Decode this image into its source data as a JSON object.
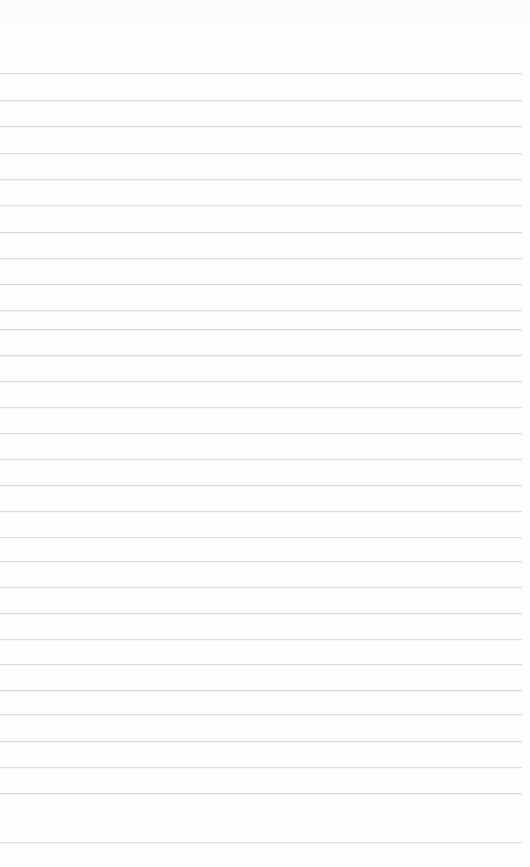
{
  "document": {
    "type": "lined-paper",
    "title": "Blank Ruled Notebook Page",
    "page_label": "",
    "text_content": "",
    "has_text": false,
    "has_handwriting": false,
    "has_margin_rule": false,
    "has_holes": false,
    "orientation": "portrait"
  },
  "canvas": {
    "width": 530,
    "height": 867,
    "background_color": "#ffffff",
    "paper_color": "#fefefe"
  },
  "ruling": {
    "line_color": "#b8bcc0",
    "line_thickness_px": 1,
    "line_spacing_px": 26.5,
    "line_count": 30,
    "first_line_y": 73,
    "last_line_y": 842,
    "line_start_x": 0,
    "line_end_x": 522,
    "top_margin_px": 72,
    "bottom_margin_px": 25,
    "right_inset_px": 8,
    "line_opacities": [
      0.55,
      0.5,
      0.55,
      0.5,
      0.52,
      0.45,
      0.55,
      0.5,
      0.55,
      0.48,
      0.52,
      0.55,
      0.5,
      0.46,
      0.55,
      0.5,
      0.55,
      0.52,
      0.45,
      0.55,
      0.5,
      0.55,
      0.48,
      0.52,
      0.55,
      0.5,
      0.55,
      0.45,
      0.52,
      0.5
    ],
    "line_positions_y": [
      73,
      100,
      126,
      153,
      179,
      205,
      232,
      258,
      284,
      310,
      329,
      355,
      381,
      407,
      433,
      459,
      485,
      511,
      537,
      561,
      587,
      613,
      639,
      664,
      690,
      714,
      741,
      767,
      793,
      842
    ]
  },
  "writing_lines": [
    {
      "index": 1,
      "content": ""
    },
    {
      "index": 2,
      "content": ""
    },
    {
      "index": 3,
      "content": ""
    },
    {
      "index": 4,
      "content": ""
    },
    {
      "index": 5,
      "content": ""
    },
    {
      "index": 6,
      "content": ""
    },
    {
      "index": 7,
      "content": ""
    },
    {
      "index": 8,
      "content": ""
    },
    {
      "index": 9,
      "content": ""
    },
    {
      "index": 10,
      "content": ""
    },
    {
      "index": 11,
      "content": ""
    },
    {
      "index": 12,
      "content": ""
    },
    {
      "index": 13,
      "content": ""
    },
    {
      "index": 14,
      "content": ""
    },
    {
      "index": 15,
      "content": ""
    },
    {
      "index": 16,
      "content": ""
    },
    {
      "index": 17,
      "content": ""
    },
    {
      "index": 18,
      "content": ""
    },
    {
      "index": 19,
      "content": ""
    },
    {
      "index": 20,
      "content": ""
    },
    {
      "index": 21,
      "content": ""
    },
    {
      "index": 22,
      "content": ""
    },
    {
      "index": 23,
      "content": ""
    },
    {
      "index": 24,
      "content": ""
    },
    {
      "index": 25,
      "content": ""
    },
    {
      "index": 26,
      "content": ""
    },
    {
      "index": 27,
      "content": ""
    },
    {
      "index": 28,
      "content": ""
    },
    {
      "index": 29,
      "content": ""
    },
    {
      "index": 30,
      "content": ""
    }
  ]
}
